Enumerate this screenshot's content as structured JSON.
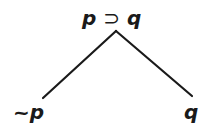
{
  "tree": {
    "root": {
      "antecedent": "p",
      "operator": "⊃",
      "consequent": "q"
    },
    "branches": [
      {
        "label": "~p"
      },
      {
        "label": "q"
      }
    ],
    "line_color": "#1a1a1a"
  }
}
